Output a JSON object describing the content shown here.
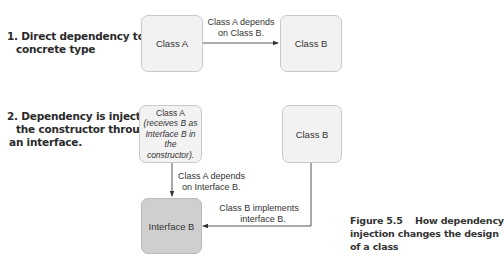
{
  "section1": {
    "heading_line1": "1. Direct dependency to a",
    "heading_line2": "concrete type",
    "class_a": "Class A",
    "class_b": "Class B",
    "arrow_label_line1": "Class A depends",
    "arrow_label_line2": "on Class B."
  },
  "section2": {
    "heading_line1": "2. Dependency is injected on",
    "heading_line2": "the constructor through",
    "heading_line3": "an interface.",
    "class_a_title": "Class A",
    "class_a_sub_line1": "(receives B as",
    "class_a_sub_line2": "Interface B in",
    "class_a_sub_line3": "the constructor).",
    "class_b": "Class B",
    "interface_b": "Interface B",
    "depends_label_line1": "Class A depends",
    "depends_label_line2": "on Interface B.",
    "implements_label_line1": "Class B implements",
    "implements_label_line2": "interface B."
  },
  "caption": {
    "line1": "Figure 5.5    How dependency",
    "line2": "injection changes the design",
    "line3": "of a class"
  },
  "colors": {
    "box_fill": "#f2f2f2",
    "interface_fill": "#cfcfcf",
    "line": "#555555"
  }
}
